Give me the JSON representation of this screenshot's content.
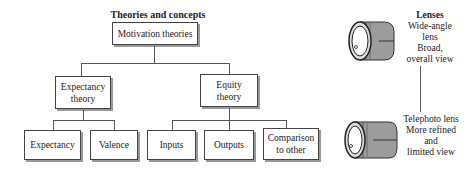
{
  "diagram": {
    "title": "Theories and concepts",
    "root": {
      "label": "Motivation theories"
    },
    "branches": [
      {
        "label_lines": [
          "Expectancy",
          "theory"
        ],
        "children": [
          "Expectancy",
          "Valence"
        ]
      },
      {
        "label_lines": [
          "Equity",
          "theory"
        ],
        "children": [
          "Inputs",
          "Outputs",
          "Comparison to other"
        ],
        "comparison_lines": [
          "Comparison",
          "to other"
        ]
      }
    ]
  },
  "lenses": {
    "title": "Lenses",
    "wide": {
      "lines": [
        "Wide-angle",
        "lens",
        "Broad,",
        "overall view"
      ]
    },
    "tele": {
      "lines": [
        "Telephoto lens",
        "More refined",
        "and",
        "limited view"
      ]
    }
  }
}
